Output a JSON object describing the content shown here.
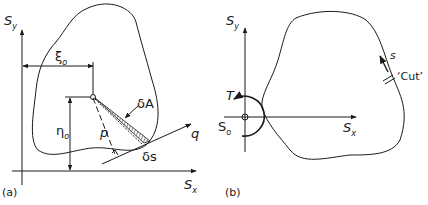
{
  "panel_a": {
    "caption": "(a)",
    "axis_y": {
      "main": "S",
      "sub": "y"
    },
    "axis_x": {
      "main": "S",
      "sub": "x"
    },
    "xi0": {
      "main": "ξ",
      "sub": "o"
    },
    "eta0": {
      "main": "η",
      "sub": "o"
    },
    "p": "p",
    "dA": "δA",
    "ds": "δs",
    "q": "q"
  },
  "panel_b": {
    "caption": "(b)",
    "axis_y": {
      "main": "S",
      "sub": "y"
    },
    "axis_x": {
      "main": "S",
      "sub": "x"
    },
    "T": "T",
    "S0": {
      "main": "S",
      "sub": "o"
    },
    "s": "s",
    "cut": "‘Cut’"
  },
  "colors": {
    "stroke": "#1a1a1a",
    "background": "#ffffff"
  }
}
